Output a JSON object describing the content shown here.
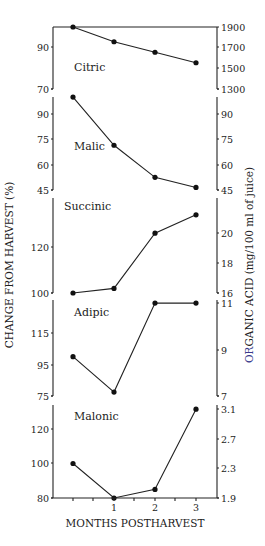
{
  "chart_data": {
    "type": "line",
    "title": "",
    "xlabel": "MONTHS POSTHARVEST",
    "ylabel_left": "CHANGE FROM HARVEST (%)",
    "ylabel_right": "ORGANIC ACID (mg/100 ml of juice)",
    "ylabel_right_accent_prefix": "OR",
    "ylabel_right_rest": "GANIC ACID (mg/100 ml of juice)",
    "x": [
      0,
      1,
      2,
      3
    ],
    "x_tick_labels": [
      "",
      "1",
      "2",
      "3"
    ],
    "grid": false,
    "legend": "none",
    "colors": {
      "ink": "#222222",
      "accent": "#3a3a8c"
    },
    "panels": [
      {
        "name": "Citric",
        "values_pct": [
          100,
          92.5,
          87.5,
          82.5
        ],
        "left_ticks": [
          90,
          70
        ],
        "left_range": [
          70,
          100
        ],
        "right_ticks": [
          1900,
          1700,
          1500,
          1300
        ]
      },
      {
        "name": "Malic",
        "values_pct": [
          100,
          71.5,
          52.5,
          46.5
        ],
        "left_ticks": [
          90,
          75,
          60,
          45
        ],
        "left_range": [
          45,
          100
        ],
        "right_ticks": [
          90,
          75,
          60,
          45
        ]
      },
      {
        "name": "Succinic",
        "values_pct": [
          100,
          102,
          126,
          134
        ],
        "left_ticks": [
          120,
          100
        ],
        "left_range": [
          100,
          140
        ],
        "right_ticks": [
          20,
          18,
          16
        ]
      },
      {
        "name": "Adipic",
        "values_pct": [
          100,
          77.5,
          134,
          134
        ],
        "left_ticks": [
          115,
          95,
          75
        ],
        "left_range": [
          75,
          135
        ],
        "right_ticks": [
          11,
          9,
          7
        ]
      },
      {
        "name": "Malonic",
        "values_pct": [
          100,
          80,
          85,
          131.5
        ],
        "left_ticks": [
          120,
          100,
          80
        ],
        "left_range": [
          80,
          135
        ],
        "right_ticks": [
          3.1,
          2.7,
          2.3,
          1.9
        ]
      }
    ]
  }
}
